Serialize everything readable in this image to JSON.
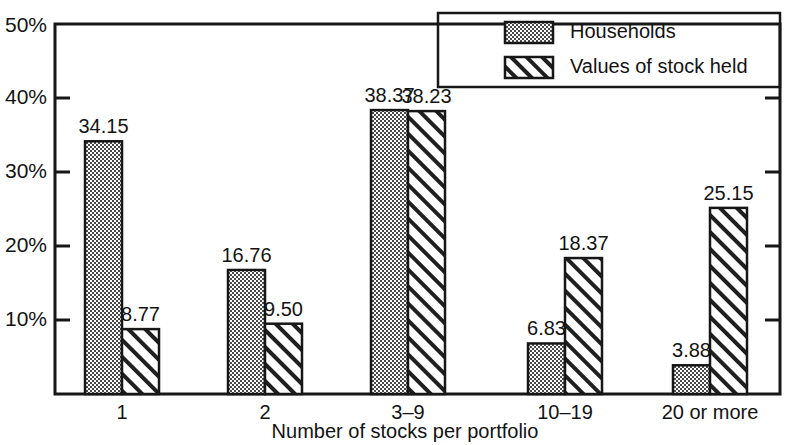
{
  "chart_data": {
    "type": "bar",
    "title": "",
    "xlabel": "Number of stocks per portfolio",
    "ylabel": "",
    "categories": [
      "1",
      "2",
      "3–9",
      "10–19",
      "20 or more"
    ],
    "series": [
      {
        "name": "Households",
        "pattern": "dotted",
        "values": [
          34.15,
          16.76,
          38.37,
          6.83,
          3.88
        ],
        "labels": [
          "34.15",
          "16.76",
          "38.37",
          "6.83",
          "3.88"
        ]
      },
      {
        "name": "Values of stock held",
        "pattern": "diagonal-hatch",
        "values": [
          8.77,
          9.5,
          38.23,
          18.37,
          25.15
        ],
        "labels": [
          "8.77",
          "9.50",
          "38.23",
          "18.37",
          "25.15"
        ]
      }
    ],
    "ylim": [
      0,
      50
    ],
    "yticks": [
      10,
      20,
      30,
      40,
      50
    ],
    "ytick_labels": [
      "10%",
      "20%",
      "30%",
      "40%",
      "50%"
    ],
    "grid": false,
    "legend_position": "top-right",
    "colors": {
      "axis": "#171717",
      "bar_outline": "#171717",
      "households_fill": "#b8b8b8",
      "values_fill": "#ffffff",
      "background": "#ffffff",
      "text": "#131313"
    }
  },
  "legend": {
    "items": [
      {
        "label": "Households",
        "swatch": "dotted-swatch"
      },
      {
        "label": "Values of stock held",
        "swatch": "hatch-swatch"
      }
    ]
  },
  "axis": {
    "x_title": "Number of stocks per portfolio",
    "y_labels": [
      "50%",
      "40%",
      "30%",
      "20%",
      "10%"
    ]
  }
}
